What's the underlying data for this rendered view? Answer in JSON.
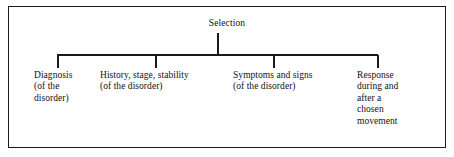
{
  "diagram": {
    "type": "tree",
    "orientation": "top-down",
    "root": {
      "label": "Selection"
    },
    "children": [
      {
        "name": "diagnosis",
        "lines": [
          "Diagnosis",
          "(of the",
          "disorder)"
        ]
      },
      {
        "name": "history-stage-stability",
        "lines": [
          "History, stage, stability",
          "(of the disorder)"
        ]
      },
      {
        "name": "symptoms-and-signs",
        "lines": [
          "Symptoms and signs",
          "(of the disorder)"
        ]
      },
      {
        "name": "response",
        "lines": [
          "Response",
          "during and",
          "after a",
          "chosen",
          "movement"
        ]
      }
    ],
    "style": {
      "line_color": "#1a1a1a",
      "text_color": "#111111",
      "background": "#ffffff",
      "border_color": "#1a1a1a"
    }
  }
}
